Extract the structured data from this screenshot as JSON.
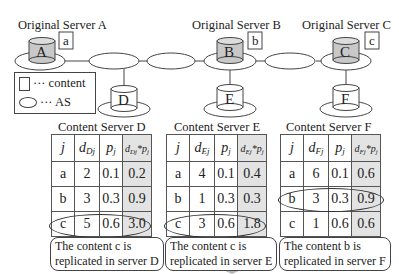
{
  "servers": {
    "A": {
      "title": "Original Server A",
      "label": "A",
      "content": "a"
    },
    "B": {
      "title": "Original Server B",
      "label": "B",
      "content": "b"
    },
    "C": {
      "title": "Original Server C",
      "label": "C",
      "content": "c"
    },
    "D": {
      "label": "D"
    },
    "E": {
      "label": "E"
    },
    "F": {
      "label": "F"
    }
  },
  "legend": {
    "content": "··· content",
    "as": "··· AS"
  },
  "tables": [
    {
      "title": "Content Server D",
      "server": "D",
      "headers": [
        "j",
        "d",
        "Dj",
        "p",
        "j",
        "d",
        "Dj",
        "*p",
        "j"
      ],
      "rows": [
        {
          "j": "a",
          "d": "2",
          "p": "0.1",
          "dp": "0.2"
        },
        {
          "j": "b",
          "d": "3",
          "p": "0.3",
          "dp": "0.9"
        },
        {
          "j": "c",
          "d": "5",
          "p": "0.6",
          "dp": "3.0"
        }
      ],
      "highlighted_row": "c",
      "note_line1": "The content c is",
      "note_line2": "replicated in server D"
    },
    {
      "title": "Content Server E",
      "server": "E",
      "headers": [
        "j",
        "d",
        "Ej",
        "p",
        "j",
        "d",
        "Ej",
        "*p",
        "j"
      ],
      "rows": [
        {
          "j": "a",
          "d": "4",
          "p": "0.1",
          "dp": "0.4"
        },
        {
          "j": "b",
          "d": "1",
          "p": "0.3",
          "dp": "0.3"
        },
        {
          "j": "c",
          "d": "3",
          "p": "0.6",
          "dp": "1.8"
        }
      ],
      "highlighted_row": "c",
      "note_line1": "The content c is",
      "note_line2": "replicated in server E"
    },
    {
      "title": "Content Server F",
      "server": "F",
      "headers": [
        "j",
        "d",
        "Fj",
        "p",
        "j",
        "d",
        "Fj",
        "*p",
        "j"
      ],
      "rows": [
        {
          "j": "a",
          "d": "6",
          "p": "0.1",
          "dp": "0.6"
        },
        {
          "j": "b",
          "d": "3",
          "p": "0.3",
          "dp": "0.9"
        },
        {
          "j": "c",
          "d": "1",
          "p": "0.6",
          "dp": "0.6"
        }
      ],
      "highlighted_row": "b",
      "note_line1": "The content b is",
      "note_line2": "replicated in server F"
    }
  ],
  "colors": {
    "server_fill": "#c8c8c8",
    "product_column_fill": "#e3e3e3",
    "arrow_fill": "#b9b9b9",
    "line": "#444444"
  }
}
